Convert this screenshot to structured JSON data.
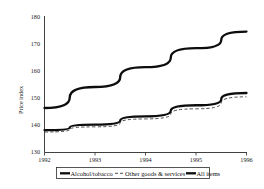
{
  "chart_data": {
    "type": "line",
    "title": "",
    "xlabel": "",
    "ylabel": "Price index",
    "x": [
      1992,
      1993,
      1994,
      1995,
      1996
    ],
    "xtick_labels": [
      "1992",
      "1993",
      "1994",
      "1995",
      "1996"
    ],
    "ytick_labels": [
      "130",
      "140",
      "150",
      "160",
      "170",
      "180"
    ],
    "yticks": [
      130,
      140,
      150,
      160,
      170,
      180
    ],
    "ylim": [
      130,
      180
    ],
    "xlim": [
      1992,
      1996
    ],
    "grid": false,
    "legend_position": "below-axes",
    "series": [
      {
        "name": "Alcohol/tobacco",
        "style": "solid-thick",
        "color": "#0d0d0d",
        "values": [
          146.3,
          154.0,
          161.3,
          168.2,
          174.3
        ]
      },
      {
        "name": "Other goods & services",
        "style": "dashed-thin",
        "color": "#3a3a3a",
        "values": [
          137.5,
          139.4,
          142.3,
          146.0,
          150.4
        ]
      },
      {
        "name": "All items",
        "style": "solid-thick",
        "color": "#0d0d0d",
        "values": [
          138.2,
          140.2,
          143.2,
          147.3,
          151.8
        ]
      }
    ]
  },
  "axis": {
    "y_title": "Price index",
    "y_ticks": [
      "180",
      "170",
      "160",
      "150",
      "140",
      "130"
    ],
    "x_ticks": [
      "1992",
      "1993",
      "1994",
      "1995",
      "1996"
    ]
  },
  "legend": {
    "items": [
      {
        "label": "Alcohol/tobacco",
        "marker": "solid-thick"
      },
      {
        "label": "Other goods & services",
        "marker": "dashed-thin"
      },
      {
        "label": "All items",
        "marker": "solid-thick"
      }
    ]
  }
}
